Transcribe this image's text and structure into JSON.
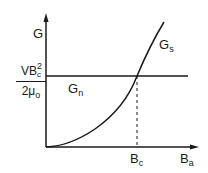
{
  "diagram": {
    "y_axis_label": "G",
    "x_axis_label_main": "B",
    "x_axis_label_sub": "a",
    "critical_field_main": "B",
    "critical_field_sub": "c",
    "level_numerator_main": "VB",
    "level_numerator_sup": "2",
    "level_numerator_sub": "c",
    "level_denominator_main": "2μ",
    "level_denominator_sub": "o",
    "normal_curve_main": "G",
    "normal_curve_sub": "n",
    "super_curve_main": "G",
    "super_curve_sub": "s",
    "colors": {
      "ink": "#1a1a1a",
      "background": "#ffffff"
    }
  }
}
